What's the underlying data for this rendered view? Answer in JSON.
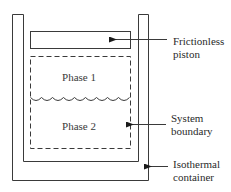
{
  "diagram": {
    "title": "",
    "colors": {
      "line": "#3a3a3a",
      "text": "#2a2a2a",
      "background": "#ffffff"
    },
    "regions": {
      "phase_1": {
        "label": "Phase 1"
      },
      "phase_2": {
        "label": "Phase 2"
      }
    },
    "annotations": [
      {
        "id": "piston",
        "lines": [
          "Frictionless",
          "piston"
        ],
        "points_to": "piston"
      },
      {
        "id": "boundary",
        "lines": [
          "System",
          "boundary"
        ],
        "points_to": "dashed system boundary"
      },
      {
        "id": "container",
        "lines": [
          "Isothermal",
          "container"
        ],
        "points_to": "container wall"
      }
    ],
    "interface": {
      "style": "wavy",
      "between": [
        "Phase 1",
        "Phase 2"
      ]
    }
  }
}
